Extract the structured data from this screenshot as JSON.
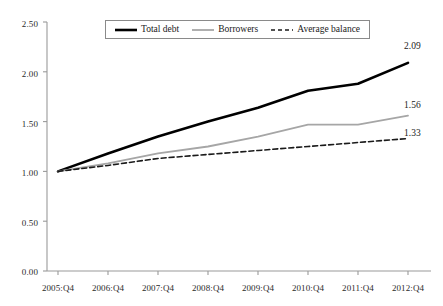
{
  "chart_data": {
    "type": "line",
    "title": "",
    "xlabel": "",
    "ylabel": "",
    "categories": [
      "2005:Q4",
      "2006:Q4",
      "2007:Q4",
      "2008:Q4",
      "2009:Q4",
      "2010:Q4",
      "2011:Q4",
      "2012:Q4"
    ],
    "ylim": [
      0.0,
      2.5
    ],
    "ytick_labels": [
      "0.00",
      "0.50",
      "1.00",
      "1.50",
      "2.00",
      "2.50"
    ],
    "ytick_values": [
      0.0,
      0.5,
      1.0,
      1.5,
      2.0,
      2.5
    ],
    "grid": false,
    "legend_position": "top-center",
    "series": [
      {
        "name": "Total debt",
        "style": "solid",
        "color": "#000000",
        "width": 2.6,
        "values": [
          1.0,
          1.18,
          1.35,
          1.5,
          1.64,
          1.81,
          1.88,
          2.09
        ],
        "end_label": "2.09"
      },
      {
        "name": "Borrowers",
        "style": "solid",
        "color": "#a6a6a6",
        "width": 1.8,
        "values": [
          1.0,
          1.08,
          1.18,
          1.25,
          1.35,
          1.47,
          1.47,
          1.56
        ],
        "end_label": "1.56"
      },
      {
        "name": "Average balance",
        "style": "dashed",
        "color": "#1a1a1a",
        "width": 1.6,
        "values": [
          1.0,
          1.06,
          1.13,
          1.17,
          1.21,
          1.25,
          1.29,
          1.33
        ],
        "end_label": "1.33"
      }
    ],
    "annotations": [
      {
        "text": "2.09",
        "series": "Total debt",
        "at": "2012:Q4"
      },
      {
        "text": "1.56",
        "series": "Borrowers",
        "at": "2012:Q4"
      },
      {
        "text": "1.33",
        "series": "Average balance",
        "at": "2012:Q4"
      }
    ]
  },
  "legend": {
    "entries": [
      {
        "label": "Total debt"
      },
      {
        "label": "Borrowers"
      },
      {
        "label": "Average balance"
      }
    ]
  },
  "axes": {
    "y_labels": [
      "2.50",
      "2.00",
      "1.50",
      "1.00",
      "0.50",
      "0.00"
    ],
    "x_labels": [
      "2005:Q4",
      "2006:Q4",
      "2007:Q4",
      "2008:Q4",
      "2009:Q4",
      "2010:Q4",
      "2011:Q4",
      "2012:Q4"
    ]
  },
  "endpoint_labels": {
    "total_debt": "2.09",
    "borrowers": "1.56",
    "average_balance": "1.33"
  },
  "header": {
    "cropped_text": ""
  }
}
